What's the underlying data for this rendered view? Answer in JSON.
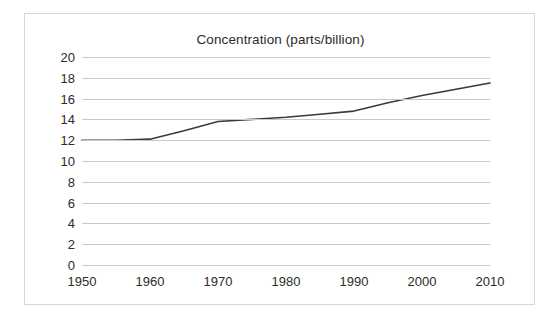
{
  "chart_data": {
    "type": "line",
    "title": "Concentration (parts/billion)",
    "xlabel": "",
    "ylabel": "",
    "x": [
      1950,
      1955,
      1960,
      1965,
      1970,
      1975,
      1980,
      1985,
      1990,
      1995,
      2000,
      2005,
      2010
    ],
    "series": [
      {
        "name": "Concentration",
        "values": [
          12.0,
          12.0,
          12.1,
          12.9,
          13.8,
          14.0,
          14.2,
          14.5,
          14.8,
          15.6,
          16.3,
          16.9,
          17.5
        ],
        "color": "#3a3a3a"
      }
    ],
    "xlim": [
      1950,
      2010
    ],
    "ylim": [
      0,
      20
    ],
    "xticks": [
      1950,
      1960,
      1970,
      1980,
      1990,
      2000,
      2010
    ],
    "xtick_labels": [
      "1950",
      "1960",
      "1970",
      "1980",
      "1990",
      "2000",
      "2010"
    ],
    "yticks": [
      0,
      2,
      4,
      6,
      8,
      10,
      12,
      14,
      16,
      18,
      20
    ],
    "ytick_labels": [
      "0",
      "2",
      "4",
      "6",
      "8",
      "10",
      "12",
      "14",
      "16",
      "18",
      "20"
    ],
    "grid": "horizontal",
    "legend": "none",
    "gridline_color": "#c9c9c9",
    "border_color": "#d7d7d7",
    "background_color": "#ffffff",
    "text_color": "#2b2b2b"
  }
}
